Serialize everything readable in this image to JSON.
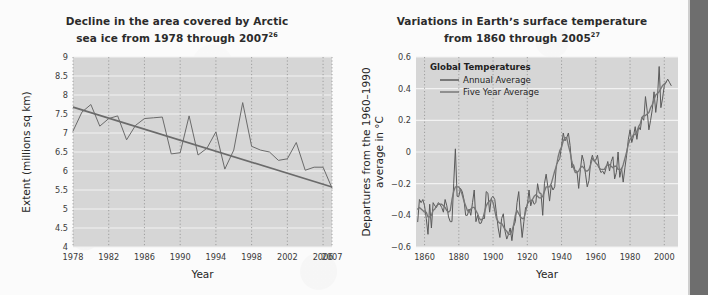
{
  "page": {
    "background_color": "#fbfbfb",
    "rail_color": "#6e6e6e"
  },
  "figures": [
    {
      "id": "arctic-sea-ice",
      "title_line1": "Decline in the area covered by Arctic",
      "title_line2": "sea ice from 1978 through 2007",
      "title_superscript": "26"
    },
    {
      "id": "surface-temperature",
      "title_line1": "Variations in Earthʼs surface temperature",
      "title_line2": "from 1860 through 2005",
      "title_superscript": "27"
    }
  ],
  "chart_data": [
    {
      "type": "line",
      "id": "arctic-sea-ice",
      "title": "Decline in the area covered by Arctic sea ice from 1978 through 2007",
      "title_superscript": "26",
      "xlabel": "Year",
      "ylabel": "Extent (millions sq km)",
      "xlim": [
        1978,
        2007
      ],
      "ylim": [
        4,
        9
      ],
      "yticks": [
        4,
        4.5,
        5,
        5.5,
        6,
        6.5,
        7,
        7.5,
        8,
        8.5,
        9
      ],
      "ytick_labels": [
        "4",
        "4.5",
        "5",
        "5.5",
        "6",
        "6.5",
        "7",
        "7.5",
        "8",
        "8.5",
        "9"
      ],
      "xticks": [
        1978,
        1982,
        1986,
        1990,
        1994,
        1998,
        2002,
        2006,
        2007
      ],
      "xtick_labels": [
        "1978",
        "1982",
        "1986",
        "1990",
        "1994",
        "1998",
        "2002",
        "2006",
        "2007"
      ],
      "grid": {
        "horizontal": "solid-white",
        "vertical": "dotted-gray"
      },
      "plot_background": "#d6d6d6",
      "line_color": "#6b6b6b",
      "trend_color": "#6b6b6b",
      "legend": null,
      "x": [
        1978,
        1979,
        1980,
        1981,
        1982,
        1983,
        1984,
        1985,
        1986,
        1987,
        1988,
        1989,
        1990,
        1991,
        1992,
        1993,
        1994,
        1995,
        1996,
        1997,
        1998,
        1999,
        2000,
        2001,
        2002,
        2003,
        2004,
        2005,
        2006,
        2007
      ],
      "series": [
        {
          "name": "Arctic sea ice extent",
          "values": [
            7.05,
            7.55,
            7.75,
            7.18,
            7.38,
            7.45,
            6.82,
            7.2,
            7.38,
            7.4,
            7.42,
            6.45,
            6.48,
            7.45,
            6.42,
            6.6,
            7.03,
            6.05,
            6.55,
            7.8,
            6.65,
            6.55,
            6.5,
            6.28,
            6.32,
            6.75,
            6.02,
            6.1,
            6.1,
            5.55,
            5.8,
            4.15
          ]
        }
      ],
      "trendline": {
        "name": "Linear trend",
        "start_value": 7.68,
        "end_value": 5.58
      },
      "annotations": []
    },
    {
      "type": "line",
      "id": "surface-temperature",
      "title": "Variations in Earthʼs surface temperature from 1860 through 2005",
      "title_superscript": "27",
      "xlabel": "Year",
      "ylabel": "Departures from the 1960–1990 average in °C",
      "ylabel_line1": "Departures from the 1960–1990",
      "ylabel_line2": "average in °C",
      "xlim": [
        1855,
        2008
      ],
      "ylim": [
        -0.6,
        0.6
      ],
      "yticks": [
        -0.6,
        -0.4,
        -0.2,
        0,
        0.2,
        0.4,
        0.6
      ],
      "ytick_labels": [
        "−0.6",
        "−0.4",
        "−0.2",
        "0",
        "0.2",
        "0.4",
        "0.6"
      ],
      "xticks": [
        1860,
        1880,
        1900,
        1920,
        1940,
        1960,
        1980,
        2000
      ],
      "xtick_labels": [
        "1860",
        "1880",
        "1900",
        "1920",
        "1940",
        "1960",
        "1980",
        "2000"
      ],
      "grid": {
        "horizontal": "solid-white",
        "vertical": "dotted-gray"
      },
      "plot_background": "#d6d6d6",
      "legend": {
        "title": "Global Temperatures",
        "position": "top-left-inside",
        "entries": [
          {
            "label": "Annual Average",
            "color": "#5a5a5a"
          },
          {
            "label": "Five Year Average",
            "color": "#777777"
          }
        ]
      },
      "x": [
        1856,
        1857,
        1858,
        1859,
        1860,
        1861,
        1862,
        1863,
        1864,
        1865,
        1866,
        1867,
        1868,
        1869,
        1870,
        1871,
        1872,
        1873,
        1874,
        1875,
        1876,
        1877,
        1878,
        1879,
        1880,
        1881,
        1882,
        1883,
        1884,
        1885,
        1886,
        1887,
        1888,
        1889,
        1890,
        1891,
        1892,
        1893,
        1894,
        1895,
        1896,
        1897,
        1898,
        1899,
        1900,
        1901,
        1902,
        1903,
        1904,
        1905,
        1906,
        1907,
        1908,
        1909,
        1910,
        1911,
        1912,
        1913,
        1914,
        1915,
        1916,
        1917,
        1918,
        1919,
        1920,
        1921,
        1922,
        1923,
        1924,
        1925,
        1926,
        1927,
        1928,
        1929,
        1930,
        1931,
        1932,
        1933,
        1934,
        1935,
        1936,
        1937,
        1938,
        1939,
        1940,
        1941,
        1942,
        1943,
        1944,
        1945,
        1946,
        1947,
        1948,
        1949,
        1950,
        1951,
        1952,
        1953,
        1954,
        1955,
        1956,
        1957,
        1958,
        1959,
        1960,
        1961,
        1962,
        1963,
        1964,
        1965,
        1966,
        1967,
        1968,
        1969,
        1970,
        1971,
        1972,
        1973,
        1974,
        1975,
        1976,
        1977,
        1978,
        1979,
        1980,
        1981,
        1982,
        1983,
        1984,
        1985,
        1986,
        1987,
        1988,
        1989,
        1990,
        1991,
        1992,
        1993,
        1994,
        1995,
        1996,
        1997,
        1998,
        1999,
        2000,
        2001,
        2002,
        2003,
        2004,
        2005
      ],
      "series": [
        {
          "name": "Annual Average",
          "color": "#5a5a5a",
          "values": [
            -0.44,
            -0.3,
            -0.32,
            -0.3,
            -0.34,
            -0.42,
            -0.52,
            -0.33,
            -0.48,
            -0.32,
            -0.34,
            -0.35,
            -0.32,
            -0.33,
            -0.35,
            -0.38,
            -0.3,
            -0.34,
            -0.41,
            -0.44,
            -0.44,
            -0.2,
            0.02,
            -0.28,
            -0.28,
            -0.23,
            -0.25,
            -0.3,
            -0.4,
            -0.4,
            -0.36,
            -0.4,
            -0.32,
            -0.24,
            -0.44,
            -0.4,
            -0.45,
            -0.45,
            -0.42,
            -0.42,
            -0.25,
            -0.26,
            -0.38,
            -0.29,
            -0.28,
            -0.3,
            -0.39,
            -0.48,
            -0.54,
            -0.42,
            -0.39,
            -0.5,
            -0.55,
            -0.52,
            -0.48,
            -0.56,
            -0.47,
            -0.44,
            -0.32,
            -0.25,
            -0.42,
            -0.54,
            -0.44,
            -0.35,
            -0.34,
            -0.24,
            -0.34,
            -0.3,
            -0.33,
            -0.32,
            -0.2,
            -0.26,
            -0.26,
            -0.4,
            -0.2,
            -0.14,
            -0.22,
            -0.31,
            -0.21,
            -0.24,
            -0.22,
            -0.08,
            -0.06,
            -0.04,
            0.04,
            0.12,
            0.07,
            0.09,
            0.12,
            0.04,
            -0.1,
            -0.08,
            -0.12,
            -0.12,
            -0.23,
            -0.11,
            -0.02,
            -0.06,
            -0.14,
            -0.22,
            -0.18,
            -0.06,
            -0.02,
            -0.06,
            -0.05,
            -0.02,
            -0.1,
            -0.13,
            -0.12,
            -0.14,
            -0.1,
            -0.06,
            -0.12,
            -0.06,
            -0.03,
            -0.17,
            -0.13,
            0.0,
            -0.16,
            -0.1,
            -0.19,
            -0.1,
            -0.02,
            0.08,
            0.14,
            0.06,
            0.1,
            0.16,
            0.08,
            0.16,
            0.14,
            0.22,
            0.2,
            0.35,
            0.26,
            0.14,
            0.2,
            0.27,
            0.38,
            0.25,
            0.34,
            0.54,
            0.28,
            0.34,
            0.42,
            0.44,
            0.46,
            0.44,
            0.42
          ]
        },
        {
          "name": "Five Year Average",
          "color": "#777777",
          "values": [
            -0.36,
            -0.35,
            -0.36,
            -0.37,
            -0.38,
            -0.38,
            -0.41,
            -0.41,
            -0.4,
            -0.37,
            -0.36,
            -0.34,
            -0.33,
            -0.33,
            -0.33,
            -0.34,
            -0.35,
            -0.37,
            -0.38,
            -0.37,
            -0.3,
            -0.25,
            -0.22,
            -0.22,
            -0.22,
            -0.24,
            -0.27,
            -0.31,
            -0.34,
            -0.37,
            -0.38,
            -0.36,
            -0.35,
            -0.35,
            -0.37,
            -0.39,
            -0.42,
            -0.43,
            -0.42,
            -0.38,
            -0.34,
            -0.32,
            -0.31,
            -0.3,
            -0.32,
            -0.37,
            -0.42,
            -0.44,
            -0.45,
            -0.45,
            -0.47,
            -0.49,
            -0.5,
            -0.52,
            -0.52,
            -0.5,
            -0.46,
            -0.4,
            -0.37,
            -0.39,
            -0.41,
            -0.42,
            -0.42,
            -0.38,
            -0.33,
            -0.31,
            -0.31,
            -0.3,
            -0.28,
            -0.27,
            -0.28,
            -0.29,
            -0.29,
            -0.28,
            -0.25,
            -0.22,
            -0.22,
            -0.22,
            -0.2,
            -0.16,
            -0.12,
            -0.09,
            -0.03,
            0.01,
            0.03,
            0.07,
            0.09,
            0.09,
            0.04,
            0.0,
            -0.06,
            -0.1,
            -0.13,
            -0.13,
            -0.12,
            -0.1,
            -0.09,
            -0.1,
            -0.12,
            -0.12,
            -0.11,
            -0.08,
            -0.04,
            -0.05,
            -0.07,
            -0.08,
            -0.1,
            -0.11,
            -0.11,
            -0.11,
            -0.09,
            -0.08,
            -0.08,
            -0.09,
            -0.1,
            -0.09,
            -0.09,
            -0.11,
            -0.11,
            -0.11,
            -0.08,
            -0.04,
            0.0,
            0.05,
            0.08,
            0.09,
            0.11,
            0.11,
            0.13,
            0.16,
            0.18,
            0.22,
            0.23,
            0.23,
            0.24,
            0.25,
            0.28,
            0.3,
            0.33,
            0.36,
            0.37,
            0.38,
            0.4,
            0.42,
            0.43,
            0.44
          ]
        }
      ],
      "annotations": []
    }
  ]
}
